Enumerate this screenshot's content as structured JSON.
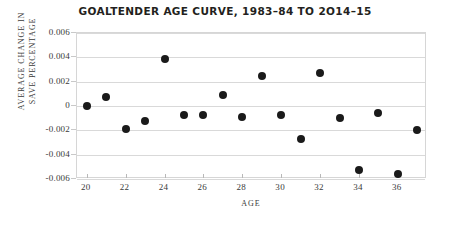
{
  "chart_data": {
    "type": "scatter",
    "title": "GOALTENDER AGE CURVE, 1983–84 TO 2O14–15",
    "xlabel": "AGE",
    "ylabel": "AVERAGE CHANGE IN SAVE PERCENTAGE",
    "ylabel_lines": [
      "AVERAGE CHANGE IN",
      "SAVE PERCENTAGE"
    ],
    "xlim": [
      19.5,
      37.5
    ],
    "ylim": [
      -0.006,
      0.006
    ],
    "grid": true,
    "legend": "none",
    "marker": {
      "shape": "circle",
      "color": "#1a1a1a",
      "size_px": 8
    },
    "xticks": [
      20,
      22,
      24,
      26,
      28,
      30,
      32,
      34,
      36
    ],
    "xtick_labels": [
      "20",
      "22",
      "24",
      "26",
      "28",
      "30",
      "32",
      "34",
      "36"
    ],
    "yticks": [
      0.006,
      0.004,
      0.002,
      0,
      -0.002,
      -0.004,
      -0.006
    ],
    "ytick_labels": [
      "0.006",
      "0.004",
      "0.002",
      "0",
      "-0.002",
      "-0.004",
      "-0.006"
    ],
    "x": [
      20,
      21,
      22,
      23,
      24,
      25,
      26,
      27,
      28,
      29,
      30,
      31,
      32,
      33,
      34,
      35,
      36,
      37
    ],
    "y": [
      0.0,
      0.0007,
      -0.0019,
      -0.0012,
      0.0039,
      -0.0007,
      -0.0007,
      0.0009,
      -0.0009,
      0.0025,
      -0.0007,
      -0.0027,
      0.0027,
      -0.001,
      -0.0053,
      -0.0006,
      -0.0056,
      -0.002
    ],
    "series": [
      {
        "name": "Average change in save percentage",
        "points": [
          {
            "age": 20,
            "value": 0.0
          },
          {
            "age": 21,
            "value": 0.0007
          },
          {
            "age": 22,
            "value": -0.0019
          },
          {
            "age": 23,
            "value": -0.0012
          },
          {
            "age": 24,
            "value": 0.0039
          },
          {
            "age": 25,
            "value": -0.0007
          },
          {
            "age": 26,
            "value": -0.0007
          },
          {
            "age": 27,
            "value": 0.0009
          },
          {
            "age": 28,
            "value": -0.0009
          },
          {
            "age": 29,
            "value": 0.0025
          },
          {
            "age": 30,
            "value": -0.0007
          },
          {
            "age": 31,
            "value": -0.0027
          },
          {
            "age": 32,
            "value": 0.0027
          },
          {
            "age": 33,
            "value": -0.001
          },
          {
            "age": 34,
            "value": -0.0053
          },
          {
            "age": 35,
            "value": -0.0006
          },
          {
            "age": 36,
            "value": -0.0056
          },
          {
            "age": 37,
            "value": -0.002
          }
        ]
      }
    ],
    "colors": {
      "background": "#ffffff",
      "marker": "#1a1a1a",
      "grid": "#d9d9d9",
      "frame": "#d6d6d6",
      "text": "#231f20",
      "axis_text": "#3a3a3a"
    }
  }
}
